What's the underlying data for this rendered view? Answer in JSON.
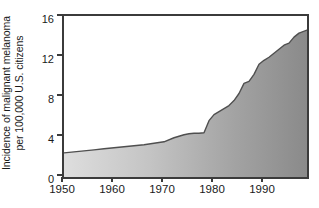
{
  "chart_data": {
    "type": "area",
    "title": "",
    "subtitle": "",
    "xlabel": "",
    "ylabel": "Incidence of malignant melanoma per 100,000 U.S. citizens",
    "ylabel_line1": "Incidence of malignant melanoma",
    "ylabel_line2": "per 100,000 U.S. citizens",
    "xlim": [
      1950,
      1998.6
    ],
    "ylim": [
      0,
      16
    ],
    "xticks": [
      1950,
      1960,
      1970,
      1980,
      1990
    ],
    "xtick_labels": [
      "1950",
      "1960",
      "1970",
      "1980",
      "1990"
    ],
    "yticks": [
      0,
      4,
      8,
      12,
      16
    ],
    "ytick_labels": [
      "0",
      "4",
      "8",
      "12",
      "16"
    ],
    "grid": false,
    "legend": null,
    "fill_gradient_from": "#dcdcdc",
    "fill_gradient_to": "#8a8a8a",
    "line_color": "#4a4a4a",
    "axis_color": "#3b3b3b",
    "series": [
      {
        "name": "Incidence of malignant melanoma per 100,000 U.S. citizens",
        "x": [
          1950,
          1952,
          1954,
          1956,
          1958,
          1960,
          1962,
          1964,
          1966,
          1968,
          1970,
          1972,
          1974,
          1975,
          1976,
          1977,
          1978,
          1979,
          1980,
          1981,
          1982,
          1983,
          1984,
          1985,
          1986,
          1987,
          1988,
          1989,
          1990,
          1991,
          1992,
          1993,
          1994,
          1995,
          1996,
          1997,
          1998.6
        ],
        "values": [
          2.4,
          2.5,
          2.6,
          2.7,
          2.8,
          2.9,
          3.0,
          3.1,
          3.2,
          3.35,
          3.5,
          3.9,
          4.2,
          4.3,
          4.35,
          4.35,
          4.4,
          5.6,
          6.2,
          6.5,
          6.8,
          7.1,
          7.6,
          8.3,
          9.3,
          9.5,
          10.2,
          11.2,
          11.6,
          11.9,
          12.3,
          12.7,
          13.1,
          13.3,
          13.9,
          14.3,
          14.6
        ]
      }
    ]
  }
}
